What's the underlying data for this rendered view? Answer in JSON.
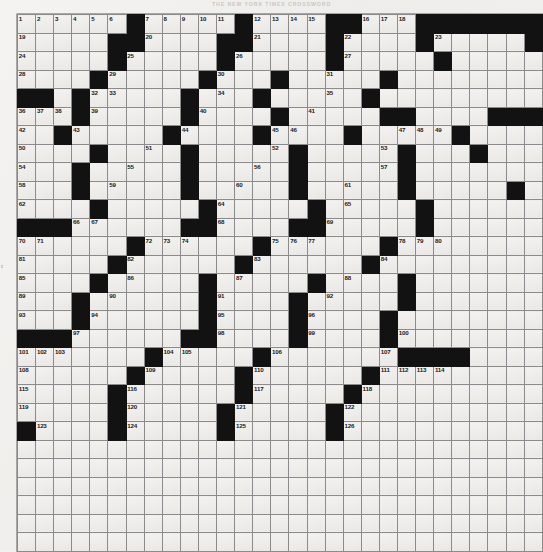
{
  "header": {
    "title": "THE NEW YORK TIMES CROSSWORD"
  },
  "margin": {
    "mark": "r"
  },
  "grid": {
    "columns": 29,
    "rows": 29,
    "black_color": "#121212",
    "cell_color": "#efeeec",
    "max_clue_number": 126,
    "layout": [
      "......#.....#....##...#######",
      ".....##....##....#....#.....#",
      ".....#.....#.....#.....#.....",
      "....#.....#...#.....#........",
      "##..#.....#...#.....#........",
      "...#.....#....#.....##....###",
      "..#.....#....#....#.....#....",
      "....#....#.....#.....#...#...",
      "...#.....#.....#.....#.......",
      "...#.....#.....#.....#.....#.",
      "....#.....#.....#.....#......",
      "...#.....#.....#......#......",
      "#..#..........####.......####",
      "#....#...#...#...#...#..#....",
      "....#.....#...#.....#....#...",
      "....#....#.....#....#....#...",
      "...#....#.....#....#.....#...",
      "...#.....#.....#....#........",
      "###..#.....#....##...#...####",
      "...#.....#....#.....#...#....",
      "....#....#....#.....#........",
      ".....#....#.....#....#.......",
      "....#.....#.....#...#........",
      "....#....#.....#.....#..#....",
      "#...#.....#...#.....#....#...",
      ".....#....#....#.....#.......",
      "......#...#....#....#........",
      "#.....##..#....#....##.......",
      "##...###..#....#....##......."
    ],
    "numbers": [
      {
        "n": 1,
        "r": 0,
        "c": 0
      },
      {
        "n": 2,
        "r": 0,
        "c": 1
      },
      {
        "n": 3,
        "r": 0,
        "c": 2
      },
      {
        "n": 4,
        "r": 0,
        "c": 3
      },
      {
        "n": 5,
        "r": 0,
        "c": 4
      },
      {
        "n": 6,
        "r": 0,
        "c": 5
      },
      {
        "n": 7,
        "r": 0,
        "c": 7
      },
      {
        "n": 8,
        "r": 0,
        "c": 8
      },
      {
        "n": 9,
        "r": 0,
        "c": 9
      },
      {
        "n": 10,
        "r": 0,
        "c": 10
      },
      {
        "n": 11,
        "r": 0,
        "c": 11
      },
      {
        "n": 12,
        "r": 0,
        "c": 13
      },
      {
        "n": 13,
        "r": 0,
        "c": 14
      },
      {
        "n": 14,
        "r": 0,
        "c": 15
      },
      {
        "n": 15,
        "r": 0,
        "c": 16
      },
      {
        "n": 16,
        "r": 0,
        "c": 19
      },
      {
        "n": 17,
        "r": 0,
        "c": 20
      },
      {
        "n": 18,
        "r": 0,
        "c": 21
      },
      {
        "n": 19,
        "r": 1,
        "c": 0
      },
      {
        "n": 20,
        "r": 1,
        "c": 7
      },
      {
        "n": 21,
        "r": 1,
        "c": 13
      },
      {
        "n": 22,
        "r": 1,
        "c": 18
      },
      {
        "n": 23,
        "r": 1,
        "c": 23
      },
      {
        "n": 24,
        "r": 2,
        "c": 0
      },
      {
        "n": 25,
        "r": 2,
        "c": 6
      },
      {
        "n": 26,
        "r": 2,
        "c": 12
      },
      {
        "n": 27,
        "r": 2,
        "c": 18
      },
      {
        "n": 28,
        "r": 3,
        "c": 0
      },
      {
        "n": 29,
        "r": 3,
        "c": 5
      },
      {
        "n": 30,
        "r": 3,
        "c": 11
      },
      {
        "n": 31,
        "r": 3,
        "c": 17
      },
      {
        "n": 32,
        "r": 4,
        "c": 4
      },
      {
        "n": 33,
        "r": 4,
        "c": 5
      },
      {
        "n": 34,
        "r": 4,
        "c": 11
      },
      {
        "n": 35,
        "r": 4,
        "c": 17
      },
      {
        "n": 36,
        "r": 5,
        "c": 0
      },
      {
        "n": 37,
        "r": 5,
        "c": 1
      },
      {
        "n": 38,
        "r": 5,
        "c": 2
      },
      {
        "n": 39,
        "r": 5,
        "c": 4
      },
      {
        "n": 40,
        "r": 5,
        "c": 10
      },
      {
        "n": 41,
        "r": 5,
        "c": 16
      },
      {
        "n": 42,
        "r": 6,
        "c": 0
      },
      {
        "n": 43,
        "r": 6,
        "c": 3
      },
      {
        "n": 44,
        "r": 6,
        "c": 9
      },
      {
        "n": 45,
        "r": 6,
        "c": 14
      },
      {
        "n": 46,
        "r": 6,
        "c": 15
      },
      {
        "n": 47,
        "r": 6,
        "c": 21
      },
      {
        "n": 48,
        "r": 6,
        "c": 22
      },
      {
        "n": 49,
        "r": 6,
        "c": 23
      },
      {
        "n": 50,
        "r": 7,
        "c": 0
      },
      {
        "n": 51,
        "r": 7,
        "c": 7
      },
      {
        "n": 52,
        "r": 7,
        "c": 14
      },
      {
        "n": 53,
        "r": 7,
        "c": 20
      },
      {
        "n": 54,
        "r": 8,
        "c": 0
      },
      {
        "n": 55,
        "r": 8,
        "c": 6
      },
      {
        "n": 56,
        "r": 8,
        "c": 13
      },
      {
        "n": 57,
        "r": 8,
        "c": 20
      },
      {
        "n": 58,
        "r": 9,
        "c": 0
      },
      {
        "n": 59,
        "r": 9,
        "c": 5
      },
      {
        "n": 60,
        "r": 9,
        "c": 12
      },
      {
        "n": 61,
        "r": 9,
        "c": 18
      },
      {
        "n": 62,
        "r": 10,
        "c": 0
      },
      {
        "n": 63,
        "r": 10,
        "c": 4
      },
      {
        "n": 64,
        "r": 10,
        "c": 11
      },
      {
        "n": 65,
        "r": 10,
        "c": 18
      },
      {
        "n": 66,
        "r": 11,
        "c": 3
      },
      {
        "n": 67,
        "r": 11,
        "c": 4
      },
      {
        "n": 68,
        "r": 11,
        "c": 11
      },
      {
        "n": 69,
        "r": 11,
        "c": 17
      },
      {
        "n": 70,
        "r": 12,
        "c": 0
      },
      {
        "n": 71,
        "r": 12,
        "c": 1
      },
      {
        "n": 72,
        "r": 12,
        "c": 7
      },
      {
        "n": 73,
        "r": 12,
        "c": 8
      },
      {
        "n": 74,
        "r": 12,
        "c": 9
      },
      {
        "n": 75,
        "r": 12,
        "c": 14
      },
      {
        "n": 76,
        "r": 12,
        "c": 15
      },
      {
        "n": 77,
        "r": 12,
        "c": 16
      },
      {
        "n": 78,
        "r": 12,
        "c": 21
      },
      {
        "n": 79,
        "r": 12,
        "c": 22
      },
      {
        "n": 80,
        "r": 12,
        "c": 23
      },
      {
        "n": 81,
        "r": 13,
        "c": 0
      },
      {
        "n": 82,
        "r": 13,
        "c": 6
      },
      {
        "n": 83,
        "r": 13,
        "c": 13
      },
      {
        "n": 84,
        "r": 13,
        "c": 20
      },
      {
        "n": 85,
        "r": 14,
        "c": 0
      },
      {
        "n": 86,
        "r": 14,
        "c": 6
      },
      {
        "n": 87,
        "r": 14,
        "c": 12
      },
      {
        "n": 88,
        "r": 14,
        "c": 18
      },
      {
        "n": 89,
        "r": 15,
        "c": 0
      },
      {
        "n": 90,
        "r": 15,
        "c": 5
      },
      {
        "n": 91,
        "r": 15,
        "c": 11
      },
      {
        "n": 92,
        "r": 15,
        "c": 17
      },
      {
        "n": 93,
        "r": 16,
        "c": 0
      },
      {
        "n": 94,
        "r": 16,
        "c": 4
      },
      {
        "n": 95,
        "r": 16,
        "c": 11
      },
      {
        "n": 96,
        "r": 16,
        "c": 16
      },
      {
        "n": 97,
        "r": 17,
        "c": 3
      },
      {
        "n": 98,
        "r": 17,
        "c": 11
      },
      {
        "n": 99,
        "r": 17,
        "c": 16
      },
      {
        "n": 100,
        "r": 17,
        "c": 21
      },
      {
        "n": 101,
        "r": 18,
        "c": 0
      },
      {
        "n": 102,
        "r": 18,
        "c": 1
      },
      {
        "n": 103,
        "r": 18,
        "c": 2
      },
      {
        "n": 104,
        "r": 18,
        "c": 8
      },
      {
        "n": 105,
        "r": 18,
        "c": 9
      },
      {
        "n": 106,
        "r": 18,
        "c": 14
      },
      {
        "n": 107,
        "r": 18,
        "c": 20
      },
      {
        "n": 108,
        "r": 19,
        "c": 0
      },
      {
        "n": 109,
        "r": 19,
        "c": 7
      },
      {
        "n": 110,
        "r": 19,
        "c": 13
      },
      {
        "n": 111,
        "r": 19,
        "c": 20
      },
      {
        "n": 112,
        "r": 19,
        "c": 21
      },
      {
        "n": 113,
        "r": 19,
        "c": 22
      },
      {
        "n": 114,
        "r": 19,
        "c": 23
      },
      {
        "n": 115,
        "r": 20,
        "c": 0
      },
      {
        "n": 116,
        "r": 20,
        "c": 6
      },
      {
        "n": 117,
        "r": 20,
        "c": 13
      },
      {
        "n": 118,
        "r": 20,
        "c": 19
      },
      {
        "n": 119,
        "r": 21,
        "c": 0
      },
      {
        "n": 120,
        "r": 21,
        "c": 6
      },
      {
        "n": 121,
        "r": 21,
        "c": 12
      },
      {
        "n": 122,
        "r": 21,
        "c": 18
      },
      {
        "n": 123,
        "r": 22,
        "c": 1
      },
      {
        "n": 124,
        "r": 22,
        "c": 6
      },
      {
        "n": 125,
        "r": 22,
        "c": 12
      },
      {
        "n": 126,
        "r": 22,
        "c": 18
      }
    ],
    "black_cells": [
      {
        "r": 0,
        "c": 6
      },
      {
        "r": 0,
        "c": 12
      },
      {
        "r": 0,
        "c": 17
      },
      {
        "r": 0,
        "c": 18
      },
      {
        "r": 0,
        "c": 22
      },
      {
        "r": 0,
        "c": 23
      },
      {
        "r": 0,
        "c": 24
      },
      {
        "r": 0,
        "c": 25
      },
      {
        "r": 0,
        "c": 26
      },
      {
        "r": 0,
        "c": 27
      },
      {
        "r": 0,
        "c": 28
      },
      {
        "r": 1,
        "c": 5
      },
      {
        "r": 1,
        "c": 6
      },
      {
        "r": 1,
        "c": 11
      },
      {
        "r": 1,
        "c": 12
      },
      {
        "r": 1,
        "c": 17
      },
      {
        "r": 1,
        "c": 22
      },
      {
        "r": 1,
        "c": 28
      },
      {
        "r": 2,
        "c": 5
      },
      {
        "r": 2,
        "c": 11
      },
      {
        "r": 2,
        "c": 17
      },
      {
        "r": 2,
        "c": 23
      },
      {
        "r": 3,
        "c": 4
      },
      {
        "r": 3,
        "c": 10
      },
      {
        "r": 3,
        "c": 14
      },
      {
        "r": 3,
        "c": 20
      },
      {
        "r": 4,
        "c": 0
      },
      {
        "r": 4,
        "c": 1
      },
      {
        "r": 4,
        "c": 3
      },
      {
        "r": 4,
        "c": 9
      },
      {
        "r": 4,
        "c": 13
      },
      {
        "r": 4,
        "c": 19
      },
      {
        "r": 5,
        "c": 3
      },
      {
        "r": 5,
        "c": 9
      },
      {
        "r": 5,
        "c": 14
      },
      {
        "r": 5,
        "c": 20
      },
      {
        "r": 5,
        "c": 21
      },
      {
        "r": 5,
        "c": 26
      },
      {
        "r": 5,
        "c": 27
      },
      {
        "r": 5,
        "c": 28
      },
      {
        "r": 6,
        "c": 2
      },
      {
        "r": 6,
        "c": 8
      },
      {
        "r": 6,
        "c": 13
      },
      {
        "r": 6,
        "c": 18
      },
      {
        "r": 6,
        "c": 24
      },
      {
        "r": 7,
        "c": 4
      },
      {
        "r": 7,
        "c": 9
      },
      {
        "r": 7,
        "c": 15
      },
      {
        "r": 7,
        "c": 21
      },
      {
        "r": 7,
        "c": 25
      },
      {
        "r": 8,
        "c": 3
      },
      {
        "r": 8,
        "c": 9
      },
      {
        "r": 8,
        "c": 15
      },
      {
        "r": 8,
        "c": 21
      },
      {
        "r": 9,
        "c": 3
      },
      {
        "r": 9,
        "c": 9
      },
      {
        "r": 9,
        "c": 15
      },
      {
        "r": 9,
        "c": 21
      },
      {
        "r": 9,
        "c": 27
      },
      {
        "r": 10,
        "c": 4
      },
      {
        "r": 10,
        "c": 10
      },
      {
        "r": 10,
        "c": 16
      },
      {
        "r": 10,
        "c": 22
      },
      {
        "r": 11,
        "c": 0
      },
      {
        "r": 11,
        "c": 1
      },
      {
        "r": 11,
        "c": 2
      },
      {
        "r": 11,
        "c": 9
      },
      {
        "r": 11,
        "c": 10
      },
      {
        "r": 11,
        "c": 15
      },
      {
        "r": 11,
        "c": 16
      },
      {
        "r": 11,
        "c": 22
      },
      {
        "r": 12,
        "c": 6
      },
      {
        "r": 12,
        "c": 13
      },
      {
        "r": 12,
        "c": 20
      },
      {
        "r": 13,
        "c": 5
      },
      {
        "r": 13,
        "c": 12
      },
      {
        "r": 13,
        "c": 19
      },
      {
        "r": 14,
        "c": 4
      },
      {
        "r": 14,
        "c": 10
      },
      {
        "r": 14,
        "c": 16
      },
      {
        "r": 14,
        "c": 21
      },
      {
        "r": 15,
        "c": 3
      },
      {
        "r": 15,
        "c": 10
      },
      {
        "r": 15,
        "c": 15
      },
      {
        "r": 15,
        "c": 21
      },
      {
        "r": 16,
        "c": 3
      },
      {
        "r": 16,
        "c": 10
      },
      {
        "r": 16,
        "c": 15
      },
      {
        "r": 16,
        "c": 20
      },
      {
        "r": 17,
        "c": 0
      },
      {
        "r": 17,
        "c": 1
      },
      {
        "r": 17,
        "c": 2
      },
      {
        "r": 17,
        "c": 9
      },
      {
        "r": 17,
        "c": 10
      },
      {
        "r": 17,
        "c": 15
      },
      {
        "r": 17,
        "c": 20
      },
      {
        "r": 18,
        "c": 7
      },
      {
        "r": 18,
        "c": 13
      },
      {
        "r": 18,
        "c": 21
      },
      {
        "r": 18,
        "c": 22
      },
      {
        "r": 18,
        "c": 23
      },
      {
        "r": 18,
        "c": 24
      },
      {
        "r": 19,
        "c": 6
      },
      {
        "r": 19,
        "c": 12
      },
      {
        "r": 19,
        "c": 19
      },
      {
        "r": 20,
        "c": 5
      },
      {
        "r": 20,
        "c": 12
      },
      {
        "r": 20,
        "c": 18
      },
      {
        "r": 21,
        "c": 5
      },
      {
        "r": 21,
        "c": 11
      },
      {
        "r": 21,
        "c": 17
      },
      {
        "r": 22,
        "c": 0
      },
      {
        "r": 22,
        "c": 5
      },
      {
        "r": 22,
        "c": 11
      },
      {
        "r": 22,
        "c": 17
      }
    ]
  }
}
